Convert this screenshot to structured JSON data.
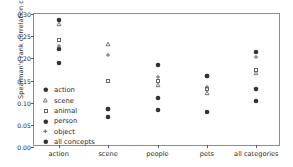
{
  "chart_data": {
    "type": "scatter",
    "title": "",
    "xlabel": "",
    "ylabel": "Spearman's rank correlation coefficient",
    "categories": [
      "action",
      "scene",
      "people",
      "pets",
      "all categories"
    ],
    "ylim": [
      0.0,
      0.3
    ],
    "yticks": [
      "0.00",
      "0.05",
      "0.10",
      "0.15",
      "0.20",
      "0.25",
      "0.30"
    ],
    "ytick_values": [
      0.0,
      0.05,
      0.1,
      0.15,
      0.2,
      0.25,
      0.3
    ],
    "grid": false,
    "legend_position": "lower left, inside axes",
    "series": [
      {
        "name": "action",
        "marker": "filled-circle",
        "color": "#333333",
        "values": [
          0.287,
          0.085,
          0.084,
          0.08,
          0.104
        ]
      },
      {
        "name": "scene",
        "marker": "small-triangle",
        "color": "#666666",
        "values": [
          0.278,
          0.233,
          0.139,
          0.122,
          0.166
        ]
      },
      {
        "name": "animal",
        "marker": "small-square",
        "color": "#666666",
        "values": [
          0.241,
          0.149,
          0.148,
          0.13,
          0.174
        ]
      },
      {
        "name": "person",
        "marker": "filled-circle",
        "color": "#333333",
        "values": [
          0.221,
          0.067,
          0.111,
          0.16,
          0.13
        ]
      },
      {
        "name": "object",
        "marker": "small-plus",
        "color": "#666666",
        "values": [
          0.228,
          0.207,
          0.157,
          0.135,
          0.204
        ]
      },
      {
        "name": "all concepts",
        "marker": "filled-circle",
        "color": "#333333",
        "values": [
          0.189,
          0.085,
          0.184,
          0.161,
          0.214
        ]
      }
    ]
  },
  "legend": {
    "items": [
      {
        "label": "action"
      },
      {
        "label": "scene"
      },
      {
        "label": "animal"
      },
      {
        "label": "person"
      },
      {
        "label": "object"
      },
      {
        "label": "all concepts"
      }
    ]
  }
}
